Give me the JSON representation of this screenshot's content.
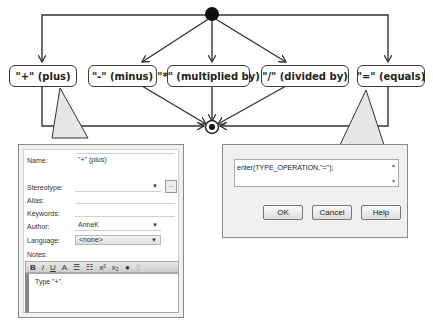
{
  "diagram": {
    "nodes": [
      {
        "id": "plus",
        "label": "\"+\"  (plus)"
      },
      {
        "id": "minus",
        "label": "\"-\" (minus)"
      },
      {
        "id": "multiply",
        "label": "\"*\" (multiplied by)"
      },
      {
        "id": "divide",
        "label": "\"/\" (divided by)"
      },
      {
        "id": "equals",
        "label": "\"=\" (equals)"
      }
    ],
    "initial_node": "filled-circle",
    "final_node": "bullseye-circle"
  },
  "properties_panel": {
    "name_label": "Name:",
    "name_value": "\"+\" (plus)",
    "stereotype_label": "Stereotype:",
    "stereotype_value": "",
    "alias_label": "Alias:",
    "alias_value": "",
    "keywords_label": "Keywords:",
    "keywords_value": "",
    "author_label": "Author:",
    "author_value": "AnneK",
    "language_label": "Language:",
    "language_value": "<none>",
    "notes_label": "Notes:",
    "notes_toolbar": [
      "B",
      "I",
      "U",
      "A",
      "bullet-list",
      "numbered-list",
      "x²",
      "x₂",
      "special",
      "extra"
    ],
    "notes_value": "Type \"+\".",
    "stereotype_button": "..."
  },
  "guard_dialog": {
    "expression": "enter(TYPE_OPERATION,\"=\");",
    "ok_label": "OK",
    "cancel_label": "Cancel",
    "help_label": "Help"
  }
}
